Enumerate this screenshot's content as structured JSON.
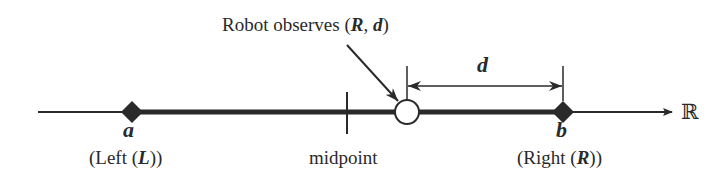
{
  "diagram": {
    "title": {
      "prefix": "Robot observes (",
      "var1": "R",
      "sep": ", ",
      "var2": "d",
      "suffix": ")"
    },
    "axis": {
      "label": "ℝ",
      "x_start": 38,
      "x_end": 672,
      "y": 112
    },
    "points": {
      "a": {
        "symbol": "a",
        "caption_prefix": "(Left (",
        "caption_var": "L",
        "caption_suffix": "))",
        "x": 132,
        "marker": "filled-diamond"
      },
      "b": {
        "symbol": "b",
        "caption_prefix": "(Right (",
        "caption_var": "R",
        "caption_suffix": "))",
        "x": 563,
        "marker": "filled-diamond"
      },
      "midpoint": {
        "label": "midpoint",
        "x": 347,
        "marker": "vertical-tick"
      },
      "robot": {
        "x": 407,
        "marker": "open-circle"
      }
    },
    "distance": {
      "label": "d",
      "from_x": 407,
      "to_x": 563,
      "y": 86
    },
    "colors": {
      "ink": "#2a2a2a",
      "background": "#ffffff"
    }
  }
}
